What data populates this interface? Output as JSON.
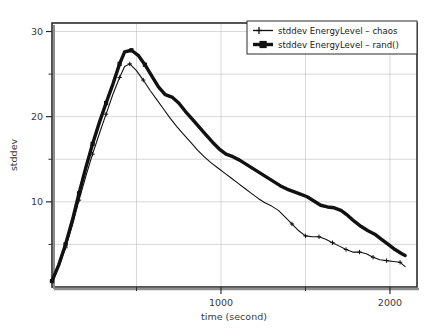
{
  "chart_data": {
    "type": "line",
    "title": "",
    "xlabel": "time (second)",
    "ylabel": "stddev",
    "xlim": [
      0,
      2160
    ],
    "ylim": [
      0,
      31
    ],
    "grid": true,
    "legend_position": "top-right",
    "x_ticks_major": [
      1000,
      2000
    ],
    "x_tick_labels": [
      "1000",
      "2000"
    ],
    "x_ticks_minor": [
      500,
      1500
    ],
    "y_ticks_major": [
      10,
      20,
      30
    ],
    "y_tick_labels": [
      "10",
      "20",
      "30"
    ],
    "y_ticks_minor": [
      5,
      15,
      25
    ],
    "series": [
      {
        "name": "stddev EnergyLevel – chaos",
        "marker": "plus",
        "line_width": 1.1,
        "color": "#111111",
        "x": [
          0,
          40,
          80,
          120,
          160,
          200,
          240,
          280,
          320,
          360,
          400,
          430,
          460,
          500,
          540,
          580,
          620,
          660,
          700,
          740,
          780,
          820,
          860,
          900,
          940,
          980,
          1020,
          1060,
          1100,
          1140,
          1180,
          1220,
          1260,
          1300,
          1340,
          1380,
          1420,
          1460,
          1500,
          1540,
          1580,
          1620,
          1660,
          1700,
          1740,
          1780,
          1820,
          1860,
          1900,
          1940,
          1980,
          2020,
          2060,
          2090
        ],
        "y": [
          0.7,
          2.4,
          4.6,
          7.2,
          10.2,
          13.0,
          15.6,
          18.0,
          20.3,
          22.6,
          24.6,
          25.9,
          26.2,
          25.4,
          24.3,
          23.1,
          22.0,
          20.9,
          19.8,
          18.8,
          17.9,
          17.0,
          16.1,
          15.3,
          14.6,
          14.0,
          13.4,
          12.8,
          12.2,
          11.6,
          11.0,
          10.4,
          9.9,
          9.5,
          9.0,
          8.2,
          7.4,
          6.6,
          6.0,
          5.9,
          5.9,
          5.6,
          5.2,
          4.8,
          4.4,
          4.1,
          4.1,
          3.9,
          3.5,
          3.2,
          3.1,
          3.0,
          2.9,
          2.4
        ]
      },
      {
        "name": "stddev EnergyLevel – rand()",
        "marker": "square",
        "line_width": 3.4,
        "color": "#111111",
        "x": [
          0,
          40,
          80,
          120,
          160,
          200,
          240,
          280,
          320,
          360,
          400,
          430,
          470,
          510,
          550,
          590,
          630,
          670,
          710,
          750,
          790,
          830,
          870,
          910,
          950,
          990,
          1030,
          1070,
          1110,
          1150,
          1190,
          1230,
          1270,
          1310,
          1350,
          1390,
          1430,
          1470,
          1510,
          1550,
          1590,
          1630,
          1670,
          1710,
          1750,
          1790,
          1830,
          1870,
          1910,
          1950,
          1990,
          2030,
          2070,
          2090
        ],
        "y": [
          0.7,
          2.6,
          5.0,
          7.8,
          11.0,
          14.0,
          16.8,
          19.3,
          21.6,
          23.8,
          26.2,
          27.6,
          27.8,
          27.2,
          26.1,
          24.8,
          23.5,
          22.6,
          22.3,
          21.6,
          20.6,
          19.7,
          18.8,
          17.9,
          17.0,
          16.2,
          15.6,
          15.3,
          14.9,
          14.4,
          13.9,
          13.4,
          12.9,
          12.4,
          11.9,
          11.5,
          11.2,
          10.9,
          10.6,
          10.1,
          9.6,
          9.4,
          9.3,
          9.0,
          8.4,
          7.7,
          7.1,
          6.6,
          6.2,
          5.6,
          5.0,
          4.4,
          3.9,
          3.7
        ]
      }
    ]
  },
  "legend": {
    "entries": [
      {
        "label": "stddev EnergyLevel – chaos"
      },
      {
        "label": "stddev EnergyLevel – rand()"
      }
    ]
  },
  "axes": {
    "x_title": "time (second)",
    "y_title": "stddev",
    "x_labels": [
      "1000",
      "2000"
    ],
    "y_labels": [
      "10",
      "20",
      "30"
    ]
  },
  "colors": {
    "series": "#111111",
    "frame": "#2b2b2b",
    "grid": "#bdbdbd",
    "text": "#3a3a3a",
    "background": "#ffffff"
  }
}
